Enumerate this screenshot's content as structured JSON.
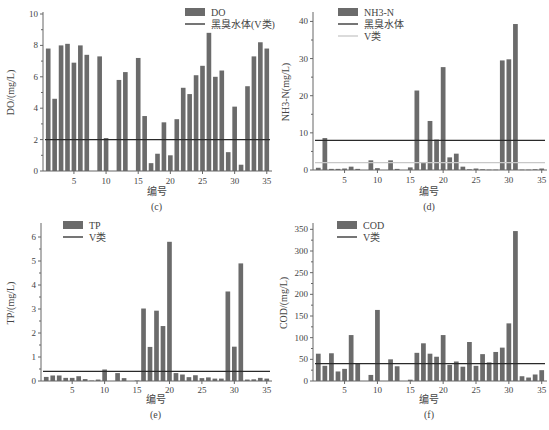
{
  "colors": {
    "bar": "#6b6b6b",
    "black_line": "#2a2a2a",
    "v_line": "#c8c8c8",
    "axis": "#666666"
  },
  "chart_data": [
    {
      "id": "c",
      "type": "bar",
      "panel_label": "(c)",
      "title": "",
      "xlabel": "编号",
      "ylabel": "DO/(mg/L)",
      "ylim": [
        0,
        10
      ],
      "yticks": [
        0,
        2,
        4,
        6,
        8,
        10
      ],
      "xticks": [
        5,
        10,
        15,
        20,
        25,
        30,
        35
      ],
      "x": [
        1,
        2,
        3,
        4,
        5,
        6,
        7,
        8,
        9,
        10,
        11,
        12,
        13,
        14,
        15,
        16,
        17,
        18,
        19,
        20,
        21,
        22,
        23,
        24,
        25,
        26,
        27,
        28,
        29,
        30,
        31,
        32,
        33,
        34,
        35
      ],
      "series": [
        {
          "name": "DO",
          "values": [
            7.8,
            4.6,
            8.0,
            8.1,
            6.9,
            8.0,
            7.4,
            0,
            7.3,
            2.1,
            0,
            5.8,
            6.3,
            0,
            7.2,
            3.5,
            0.5,
            1.1,
            3.1,
            1.0,
            3.3,
            5.3,
            4.9,
            6.1,
            6.7,
            8.8,
            6.0,
            6.4,
            1.2,
            4.1,
            0.4,
            5.4,
            7.3,
            8.2,
            7.8
          ]
        }
      ],
      "reference_lines": [
        {
          "name": "黑臭水体(V类)",
          "value": 2.0,
          "style": "black"
        }
      ],
      "legend": [
        {
          "label": "DO",
          "kind": "bar"
        },
        {
          "label": "黑臭水体(V类)",
          "kind": "line-black"
        }
      ],
      "grid": false,
      "legend_position": "top-right"
    },
    {
      "id": "d",
      "type": "bar",
      "panel_label": "(d)",
      "title": "",
      "xlabel": "编号",
      "ylabel": "NH3-N(mg/L)",
      "ylim": [
        0,
        42
      ],
      "yticks": [
        0,
        10,
        20,
        30,
        40
      ],
      "xticks": [
        5,
        10,
        15,
        20,
        25,
        30,
        35
      ],
      "x": [
        1,
        2,
        3,
        4,
        5,
        6,
        7,
        8,
        9,
        10,
        11,
        12,
        13,
        14,
        15,
        16,
        17,
        18,
        19,
        20,
        21,
        22,
        23,
        24,
        25,
        26,
        27,
        28,
        29,
        30,
        31,
        32,
        33,
        34,
        35
      ],
      "series": [
        {
          "name": "NH3-N",
          "values": [
            0.6,
            8.6,
            0.3,
            0.3,
            0.4,
            0.9,
            0.3,
            0,
            2.6,
            0.5,
            0,
            2.6,
            0.3,
            0,
            0.7,
            21.4,
            2.0,
            13.2,
            8.2,
            27.7,
            3.4,
            4.4,
            0.9,
            0.2,
            0.4,
            0.2,
            0.1,
            0.1,
            29.5,
            29.8,
            39.3,
            0.1,
            0.1,
            0.2,
            0.4
          ]
        }
      ],
      "reference_lines": [
        {
          "name": "黑臭水体",
          "value": 8.0,
          "style": "black"
        },
        {
          "name": "V类",
          "value": 2.0,
          "style": "gray"
        }
      ],
      "legend": [
        {
          "label": "NH3-N",
          "kind": "bar"
        },
        {
          "label": "黑臭水体",
          "kind": "line-black"
        },
        {
          "label": "V类",
          "kind": "line-gray"
        }
      ],
      "grid": false,
      "legend_position": "top-left"
    },
    {
      "id": "e",
      "type": "bar",
      "panel_label": "(e)",
      "title": "",
      "xlabel": "编号",
      "ylabel": "TP/(mg/L)",
      "ylim": [
        0,
        6.5
      ],
      "yticks": [
        0,
        1,
        2,
        3,
        4,
        5,
        6
      ],
      "xticks": [
        5,
        10,
        15,
        20,
        25,
        30,
        35
      ],
      "x": [
        1,
        2,
        3,
        4,
        5,
        6,
        7,
        8,
        9,
        10,
        11,
        12,
        13,
        14,
        15,
        16,
        17,
        18,
        19,
        20,
        21,
        22,
        23,
        24,
        25,
        26,
        27,
        28,
        29,
        30,
        31,
        32,
        33,
        34,
        35
      ],
      "series": [
        {
          "name": "TP",
          "values": [
            0.17,
            0.23,
            0.23,
            0.13,
            0.13,
            0.2,
            0.08,
            0.02,
            0.06,
            0.48,
            0,
            0.33,
            0.12,
            0,
            0.02,
            3.02,
            1.42,
            2.93,
            2.29,
            5.8,
            0.33,
            0.27,
            0.16,
            0.24,
            0.12,
            0.15,
            0.1,
            0.1,
            3.73,
            1.43,
            4.9,
            0.06,
            0.07,
            0.13,
            0.1
          ]
        }
      ],
      "reference_lines": [
        {
          "name": "V类",
          "value": 0.4,
          "style": "black"
        }
      ],
      "legend": [
        {
          "label": "TP",
          "kind": "bar"
        },
        {
          "label": "V类",
          "kind": "line-black"
        }
      ],
      "grid": false,
      "legend_position": "top-left"
    },
    {
      "id": "f",
      "type": "bar",
      "panel_label": "(f)",
      "title": "",
      "xlabel": "编号",
      "ylabel": "COD/(mg/L)",
      "ylim": [
        0,
        360
      ],
      "yticks": [
        0,
        50,
        100,
        150,
        200,
        250,
        300,
        350
      ],
      "xticks": [
        5,
        10,
        15,
        20,
        25,
        30,
        35
      ],
      "x": [
        1,
        2,
        3,
        4,
        5,
        6,
        7,
        8,
        9,
        10,
        11,
        12,
        13,
        14,
        15,
        16,
        17,
        18,
        19,
        20,
        21,
        22,
        23,
        24,
        25,
        26,
        27,
        28,
        29,
        30,
        31,
        32,
        33,
        34,
        35
      ],
      "series": [
        {
          "name": "COD",
          "values": [
            63,
            35,
            64,
            22,
            28,
            106,
            40,
            0,
            14,
            164,
            0,
            50,
            34,
            0,
            3,
            65,
            87,
            63,
            56,
            106,
            37,
            45,
            33,
            90,
            35,
            62,
            43,
            67,
            77,
            133,
            346,
            11,
            8,
            15,
            25
          ]
        }
      ],
      "reference_lines": [
        {
          "name": "V类",
          "value": 40,
          "style": "black"
        }
      ],
      "legend": [
        {
          "label": "COD",
          "kind": "bar"
        },
        {
          "label": "V类",
          "kind": "line-black"
        }
      ],
      "grid": false,
      "legend_position": "top-left"
    }
  ]
}
